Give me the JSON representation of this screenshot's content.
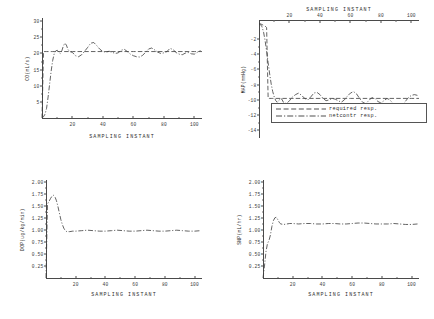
{
  "figure": {
    "xlabel": "SAMPLING INSTANT",
    "legend": {
      "items": [
        {
          "label": "required resp.",
          "dash": "dashed"
        },
        {
          "label": "netcontr resp.",
          "dash": "dash-dot"
        }
      ]
    }
  },
  "chart_data": [
    {
      "type": "line",
      "panel": "top-left",
      "title": "",
      "xlabel": "SAMPLING INSTANT",
      "ylabel": "CO(mL/s)",
      "xlim": [
        0,
        105
      ],
      "ylim": [
        0,
        31
      ],
      "xticks": [
        20,
        40,
        60,
        80,
        100
      ],
      "yticks": [
        5,
        10,
        15,
        20,
        25,
        30
      ],
      "grid": false,
      "xaxis_position": "bottom",
      "legend_position": "none",
      "series": [
        {
          "name": "required resp.",
          "style": "dashed",
          "x": [
            0,
            1,
            2,
            3,
            4,
            5,
            6,
            7,
            8,
            9,
            10,
            20,
            40,
            60,
            80,
            100,
            105
          ],
          "values": [
            0,
            20.6,
            20.6,
            20.6,
            20.6,
            20.6,
            20.6,
            20.6,
            20.6,
            20.6,
            20.6,
            20.6,
            20.6,
            20.6,
            20.6,
            20.6,
            20.6
          ]
        },
        {
          "name": "netcontr resp.",
          "style": "dash-dot",
          "x": [
            0,
            1,
            2,
            3,
            4,
            5,
            6,
            7,
            8,
            9,
            10,
            11,
            12,
            13,
            14,
            15,
            16,
            17,
            18,
            19,
            20,
            22,
            24,
            26,
            28,
            30,
            32,
            34,
            36,
            38,
            40,
            42,
            44,
            46,
            48,
            50,
            52,
            54,
            56,
            58,
            60,
            62,
            64,
            66,
            68,
            70,
            72,
            74,
            76,
            78,
            80,
            82,
            84,
            86,
            88,
            90,
            92,
            94,
            96,
            98,
            100,
            102,
            104
          ],
          "values": [
            0,
            0.4,
            1.2,
            3.0,
            6.5,
            10.5,
            14.5,
            17.8,
            19.9,
            20.8,
            21.0,
            20.4,
            20.0,
            20.8,
            22.3,
            23.2,
            22.6,
            21.3,
            20.6,
            20.5,
            20.3,
            19.3,
            19.0,
            19.6,
            20.7,
            21.9,
            23.2,
            23.4,
            22.4,
            21.3,
            20.6,
            20.4,
            20.7,
            20.4,
            20.0,
            20.2,
            21.0,
            21.3,
            20.6,
            19.8,
            19.3,
            19.0,
            18.9,
            19.4,
            20.4,
            21.4,
            21.7,
            21.1,
            20.4,
            20.0,
            20.2,
            20.6,
            21.6,
            21.2,
            20.3,
            19.8,
            19.6,
            20.1,
            20.3,
            19.9,
            19.8,
            20.4,
            20.9
          ]
        }
      ]
    },
    {
      "type": "line",
      "panel": "top-right",
      "title": "",
      "xlabel": "SAMPLING INSTANT",
      "ylabel": "MAP(mmHg)",
      "xlim": [
        0,
        105
      ],
      "ylim": [
        -15,
        0.5
      ],
      "xticks": [
        20,
        40,
        60,
        80,
        100
      ],
      "yticks": [
        -2,
        -4,
        -6,
        -8,
        -10,
        -12,
        -14
      ],
      "grid": false,
      "xaxis_position": "top",
      "legend_position": "lower-center",
      "series": [
        {
          "name": "required resp.",
          "style": "dashed",
          "x": [
            0,
            1,
            2,
            3,
            4,
            5,
            6,
            7,
            8,
            9,
            10,
            20,
            40,
            60,
            80,
            100,
            105
          ],
          "values": [
            0,
            0,
            -0.1,
            -0.2,
            -0.3,
            -0.5,
            -9.8,
            -9.8,
            -9.8,
            -9.8,
            -9.8,
            -9.8,
            -9.8,
            -9.8,
            -9.8,
            -9.8,
            -9.8
          ]
        },
        {
          "name": "netcontr resp.",
          "style": "dash-dot",
          "x": [
            0,
            1,
            2,
            3,
            4,
            5,
            6,
            7,
            8,
            9,
            10,
            11,
            12,
            13,
            14,
            15,
            16,
            18,
            20,
            22,
            24,
            26,
            28,
            30,
            32,
            34,
            36,
            38,
            40,
            42,
            44,
            46,
            48,
            50,
            52,
            54,
            56,
            58,
            60,
            62,
            64,
            66,
            68,
            70,
            72,
            74,
            76,
            78,
            80,
            82,
            84,
            86,
            88,
            90,
            92,
            94,
            96,
            98,
            100,
            102,
            104
          ],
          "values": [
            0,
            -0.1,
            -0.4,
            -1.1,
            -2.2,
            -3.6,
            -5.1,
            -6.6,
            -7.9,
            -8.9,
            -9.6,
            -10.1,
            -10.3,
            -10.1,
            -9.8,
            -9.9,
            -10.3,
            -10.5,
            -10.1,
            -9.6,
            -9.3,
            -9.1,
            -9.4,
            -9.8,
            -10.0,
            -9.6,
            -9.1,
            -9.0,
            -9.3,
            -9.8,
            -10.1,
            -10.0,
            -9.8,
            -9.9,
            -10.1,
            -10.3,
            -10.0,
            -9.5,
            -9.1,
            -8.9,
            -9.2,
            -9.8,
            -10.3,
            -10.5,
            -10.1,
            -9.7,
            -9.8,
            -10.2,
            -10.4,
            -10.1,
            -9.8,
            -10.0,
            -10.5,
            -11.0,
            -11.2,
            -10.8,
            -10.2,
            -9.7,
            -9.4,
            -9.3,
            -9.4
          ]
        }
      ]
    },
    {
      "type": "line",
      "panel": "bottom-left",
      "title": "",
      "xlabel": "SAMPLING INSTANT",
      "ylabel": "DOP(ug/kg/min)",
      "xlim": [
        0,
        105
      ],
      "ylim": [
        0,
        2.05
      ],
      "xticks": [
        20,
        40,
        60,
        80,
        100
      ],
      "yticks": [
        "0.25",
        "0.50",
        "0.75",
        "1.00",
        "1.25",
        "1.50",
        "1.75",
        "2.00"
      ],
      "grid": false,
      "xaxis_position": "bottom",
      "legend_position": "none",
      "series": [
        {
          "name": "netcontr resp.",
          "style": "dash-dot",
          "x": [
            0,
            1,
            2,
            3,
            4,
            5,
            6,
            7,
            8,
            9,
            10,
            11,
            12,
            13,
            14,
            16,
            18,
            20,
            24,
            28,
            32,
            36,
            40,
            44,
            48,
            52,
            56,
            60,
            64,
            68,
            72,
            76,
            80,
            84,
            88,
            92,
            96,
            100,
            104
          ],
          "values": [
            0,
            1.55,
            1.6,
            1.66,
            1.71,
            1.73,
            1.7,
            1.62,
            1.5,
            1.36,
            1.22,
            1.12,
            1.04,
            0.99,
            0.97,
            0.97,
            0.98,
            0.98,
            0.99,
            1.0,
            0.99,
            0.98,
            0.98,
            0.99,
            1.0,
            0.99,
            0.98,
            0.98,
            0.99,
            1.0,
            0.99,
            0.98,
            0.98,
            0.99,
            1.0,
            0.99,
            0.98,
            0.98,
            0.99
          ]
        }
      ]
    },
    {
      "type": "line",
      "panel": "bottom-right",
      "title": "",
      "xlabel": "SAMPLING INSTANT",
      "ylabel": "SNP(mL/hr)",
      "xlim": [
        0,
        105
      ],
      "ylim": [
        0,
        2.05
      ],
      "xticks": [
        20,
        40,
        60,
        80,
        100
      ],
      "yticks": [
        "0.25",
        "0.50",
        "0.75",
        "1.00",
        "1.25",
        "1.50",
        "1.75",
        "2.00"
      ],
      "grid": false,
      "xaxis_position": "bottom",
      "legend_position": "none",
      "series": [
        {
          "name": "netcontr resp.",
          "style": "dash-dot",
          "x": [
            0,
            1,
            2,
            3,
            4,
            5,
            6,
            7,
            8,
            9,
            10,
            11,
            12,
            14,
            16,
            18,
            20,
            24,
            28,
            32,
            36,
            40,
            44,
            48,
            52,
            56,
            60,
            64,
            68,
            72,
            76,
            80,
            84,
            88,
            92,
            96,
            100,
            104
          ],
          "values": [
            0,
            0.25,
            0.55,
            0.72,
            0.78,
            0.9,
            1.08,
            1.2,
            1.26,
            1.27,
            1.22,
            1.16,
            1.13,
            1.12,
            1.13,
            1.14,
            1.14,
            1.13,
            1.14,
            1.14,
            1.13,
            1.13,
            1.14,
            1.14,
            1.13,
            1.13,
            1.14,
            1.15,
            1.15,
            1.14,
            1.13,
            1.13,
            1.13,
            1.14,
            1.13,
            1.12,
            1.12,
            1.13
          ]
        }
      ]
    }
  ]
}
